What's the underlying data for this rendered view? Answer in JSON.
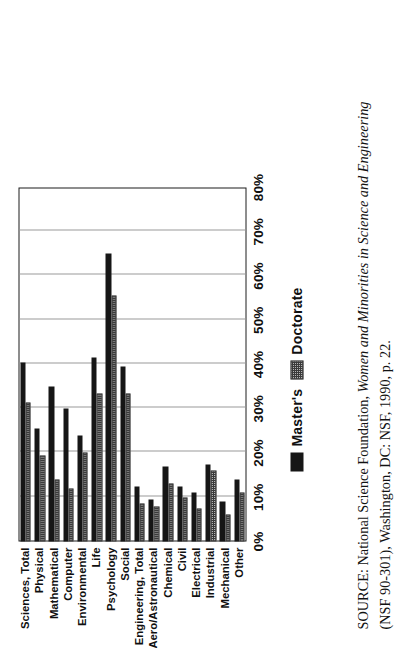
{
  "chart_data": {
    "type": "bar",
    "title": "",
    "xlabel": "",
    "ylabel": "",
    "ylim": [
      0,
      80
    ],
    "grid": true,
    "orientation": "vertical-printed-sideways",
    "legend_position": "below-axis",
    "categories": [
      "Sciences, Total",
      "Physical",
      "Mathematical",
      "Computer",
      "Environmental",
      "Life",
      "Psychology",
      "Social",
      "Engineering, Total",
      "Aero/Astronautical",
      "Chemical",
      "Civil",
      "Electrical",
      "Industrial",
      "Mechanical",
      "Other"
    ],
    "tick_labels": [
      "0%",
      "10%",
      "20%",
      "30%",
      "40%",
      "50%",
      "60%",
      "70%",
      "80%"
    ],
    "tick_values": [
      0,
      10,
      20,
      30,
      40,
      50,
      60,
      70,
      80
    ],
    "series": [
      {
        "name": "Master's",
        "color": "#161616",
        "values": [
          40.5,
          25.5,
          35.0,
          30.0,
          24.0,
          41.5,
          65.0,
          39.5,
          12.5,
          9.5,
          17.0,
          12.5,
          11.0,
          17.5,
          9.0,
          14.0
        ]
      },
      {
        "name": "Doctorate",
        "color": "#b4b4b4",
        "values": [
          31.5,
          19.5,
          14.0,
          12.0,
          20.0,
          33.5,
          55.5,
          33.5,
          8.5,
          8.0,
          13.0,
          10.0,
          7.5,
          16.0,
          6.0,
          11.0
        ]
      }
    ]
  },
  "legend": {
    "items": [
      {
        "label": "Master's",
        "swatch": "solid-black-swatch"
      },
      {
        "label": "Doctorate",
        "swatch": "hatched-gray-swatch"
      }
    ]
  },
  "source_note": {
    "label": "SOURCE:",
    "part1": "National Science Foundation,",
    "italic": "Women and Minorities in Science and Engineering",
    "part2": "(NSF 90-301), Washington, DC: NSF, 1990, p. 22."
  }
}
